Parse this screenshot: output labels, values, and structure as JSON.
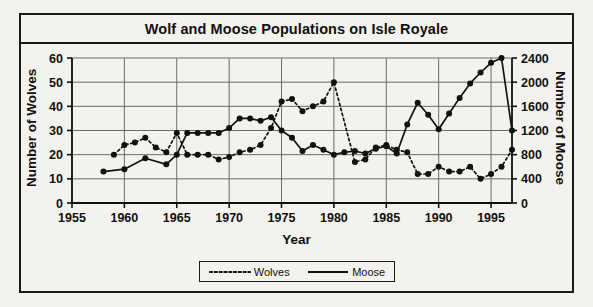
{
  "chart_data": {
    "type": "line",
    "title": "Wolf and Moose Populations on Isle Royale",
    "xlabel": "Year",
    "ylabel": "Number of Wolves",
    "ylabel_secondary": "Number of Moose",
    "xlim": [
      1955,
      1997
    ],
    "ylim": [
      0,
      60
    ],
    "ylim_secondary": [
      0,
      2400
    ],
    "xticks": [
      1955,
      1960,
      1965,
      1970,
      1975,
      1980,
      1985,
      1990,
      1995
    ],
    "yticks": [
      0,
      10,
      20,
      30,
      40,
      50,
      60
    ],
    "yticks_secondary": [
      0,
      400,
      800,
      1200,
      1600,
      2000,
      2400
    ],
    "grid": true,
    "legend_position": "bottom-center",
    "series": [
      {
        "name": "Wolves",
        "axis": "left",
        "style": "dotted",
        "marker": "circle",
        "color": "#111111",
        "points": [
          [
            1959,
            20
          ],
          [
            1960,
            24
          ],
          [
            1961,
            25
          ],
          [
            1962,
            27
          ],
          [
            1963,
            23
          ],
          [
            1964,
            21
          ],
          [
            1965,
            29
          ],
          [
            1966,
            20
          ],
          [
            1967,
            20
          ],
          [
            1968,
            20
          ],
          [
            1969,
            18
          ],
          [
            1970,
            19
          ],
          [
            1971,
            21
          ],
          [
            1972,
            22
          ],
          [
            1973,
            24
          ],
          [
            1974,
            31
          ],
          [
            1975,
            42
          ],
          [
            1976,
            43
          ],
          [
            1977,
            38
          ],
          [
            1978,
            40
          ],
          [
            1979,
            42
          ],
          [
            1980,
            50
          ],
          [
            1982,
            17
          ],
          [
            1983,
            18
          ],
          [
            1984,
            23
          ],
          [
            1985,
            24
          ],
          [
            1986,
            22
          ],
          [
            1987,
            21
          ],
          [
            1988,
            12
          ],
          [
            1989,
            12
          ],
          [
            1990,
            15
          ],
          [
            1991,
            13
          ],
          [
            1992,
            13
          ],
          [
            1993,
            15
          ],
          [
            1994,
            10
          ],
          [
            1995,
            12
          ],
          [
            1996,
            15
          ],
          [
            1997,
            22
          ]
        ]
      },
      {
        "name": "Moose",
        "axis": "right",
        "style": "solid",
        "marker": "circle",
        "color": "#111111",
        "points": [
          [
            1958,
            520
          ],
          [
            1960,
            560
          ],
          [
            1962,
            740
          ],
          [
            1964,
            640
          ],
          [
            1965,
            800
          ],
          [
            1966,
            1160
          ],
          [
            1967,
            1160
          ],
          [
            1968,
            1160
          ],
          [
            1969,
            1160
          ],
          [
            1970,
            1240
          ],
          [
            1971,
            1400
          ],
          [
            1972,
            1400
          ],
          [
            1973,
            1360
          ],
          [
            1974,
            1420
          ],
          [
            1975,
            1200
          ],
          [
            1976,
            1080
          ],
          [
            1977,
            860
          ],
          [
            1978,
            960
          ],
          [
            1979,
            880
          ],
          [
            1980,
            800
          ],
          [
            1981,
            840
          ],
          [
            1982,
            860
          ],
          [
            1983,
            820
          ],
          [
            1984,
            900
          ],
          [
            1985,
            940
          ],
          [
            1986,
            820
          ],
          [
            1987,
            1300
          ],
          [
            1988,
            1660
          ],
          [
            1989,
            1460
          ],
          [
            1990,
            1220
          ],
          [
            1991,
            1480
          ],
          [
            1992,
            1740
          ],
          [
            1993,
            1980
          ],
          [
            1994,
            2160
          ],
          [
            1995,
            2320
          ],
          [
            1996,
            2400
          ],
          [
            1997,
            1200
          ]
        ]
      }
    ]
  },
  "legend": {
    "items": [
      {
        "label": "Wolves",
        "style": "dotted"
      },
      {
        "label": "Moose",
        "style": "solid"
      }
    ]
  }
}
